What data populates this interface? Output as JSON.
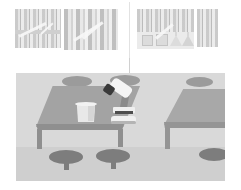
{
  "scene_title": "Science laboratory classroom illustration",
  "palette": {
    "background": "#ffffff",
    "room_wall": "#d9d9d9",
    "floor": "#cfcfcf",
    "table_top": "#a3a3a3",
    "table_frame": "#8f8f8f",
    "stool_front": "#7d7d7d",
    "stool_back": "#9b9b9b",
    "glass_white": "#e8e8e8",
    "microscope_body": "#f4f4f4",
    "microscope_dark": "#3a3a3a",
    "thumbnail_fill": "#e9e9e9",
    "divider": "#e2e2e2"
  },
  "filmstrip": {
    "label": "thumbnail strip",
    "thumbnails": [
      {
        "id": "thumb-1",
        "caption": "window blinds with counter"
      },
      {
        "id": "thumb-2",
        "caption": "window blinds panel"
      },
      {
        "id": "thumb-3",
        "caption": "blinds above glassware shelf"
      },
      {
        "id": "thumb-4",
        "caption": "narrow blinds strip"
      }
    ]
  },
  "lab_scene": {
    "label": "laboratory room",
    "tables": [
      {
        "id": "table-main",
        "caption": "front lab bench"
      },
      {
        "id": "table-right",
        "caption": "side lab bench"
      }
    ],
    "stools": [
      {
        "id": "stool-b1",
        "caption": "back stool left"
      },
      {
        "id": "stool-b2",
        "caption": "back stool right"
      },
      {
        "id": "stool-b3",
        "caption": "side table back stool"
      },
      {
        "id": "stool-f1",
        "caption": "front stool left"
      },
      {
        "id": "stool-f2",
        "caption": "front stool right"
      },
      {
        "id": "stool-f3",
        "caption": "side table front stool"
      }
    ],
    "equipment": [
      {
        "id": "beaker",
        "caption": "beaker"
      },
      {
        "id": "microscope",
        "caption": "microscope"
      }
    ]
  }
}
